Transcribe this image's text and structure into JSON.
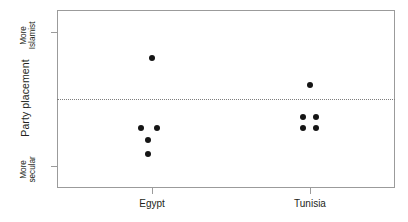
{
  "chart_data": {
    "type": "scatter",
    "title": "",
    "xlabel": "",
    "ylabel": "Party placement",
    "grid": false,
    "legend": null,
    "categories": [
      "Egypt",
      "Tunisia"
    ],
    "y_axis": {
      "range_labels": [
        "More secular",
        "More Islamist"
      ],
      "tick_labels": [
        {
          "line1": "More",
          "line2": "Islamist",
          "position": "top"
        },
        {
          "line1": "More",
          "line2": "secular",
          "position": "bottom"
        }
      ],
      "reference_line": {
        "style": "dotted",
        "label": ""
      }
    },
    "series": [
      {
        "name": "Egypt",
        "category": "Egypt",
        "points": [
          {
            "x": 152,
            "y": 58
          },
          {
            "x": 141,
            "y": 128
          },
          {
            "x": 157,
            "y": 128
          },
          {
            "x": 148,
            "y": 140
          },
          {
            "x": 148,
            "y": 154
          }
        ]
      },
      {
        "name": "Tunisia",
        "category": "Tunisia",
        "points": [
          {
            "x": 310,
            "y": 85
          },
          {
            "x": 303,
            "y": 117
          },
          {
            "x": 316,
            "y": 117
          },
          {
            "x": 303,
            "y": 128
          },
          {
            "x": 316,
            "y": 128
          }
        ]
      }
    ],
    "colors": {
      "marker": "#151515",
      "frame": "#9b9b9b",
      "reference_line": "#7d7d7d",
      "text": "#231f20",
      "background": "#ffffff"
    }
  },
  "axis": {
    "y_title": "Party placement",
    "y_top_label_line1": "More",
    "y_top_label_line2": "Islamist",
    "y_bottom_label_line1": "More",
    "y_bottom_label_line2": "secular",
    "x_tick_1": "Egypt",
    "x_tick_2": "Tunisia"
  },
  "geometry": {
    "plot_left": 57,
    "plot_top": 10,
    "plot_right": 395,
    "plot_bottom": 188,
    "reference_line_y": 99,
    "ytick_top_y": 32,
    "ytick_bottom_y": 166,
    "xtick_egypt_x": 152,
    "xtick_tunisia_x": 310
  }
}
